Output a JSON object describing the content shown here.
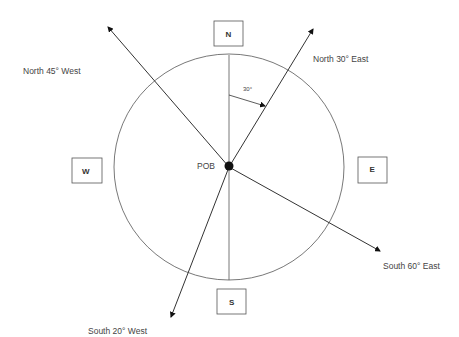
{
  "diagram": {
    "center_label": "POB",
    "compass_points": [
      {
        "id": "north",
        "label": "N"
      },
      {
        "id": "south",
        "label": "S"
      },
      {
        "id": "east",
        "label": "E"
      },
      {
        "id": "west",
        "label": "W"
      }
    ],
    "bearings": [
      {
        "id": "n30e",
        "label": "North 30° East",
        "azimuth_deg": 30
      },
      {
        "id": "n45w",
        "label": "North 45° West",
        "azimuth_deg": 315
      },
      {
        "id": "s60e",
        "label": "South 60° East",
        "azimuth_deg": 120
      },
      {
        "id": "s20w",
        "label": "South 20° West",
        "azimuth_deg": 200
      }
    ],
    "angle_annotation": {
      "label": "30°",
      "degrees": 30
    },
    "colors": {
      "line": "#333333",
      "circle": "#555555",
      "box": "#555555",
      "point": "#111111"
    }
  }
}
